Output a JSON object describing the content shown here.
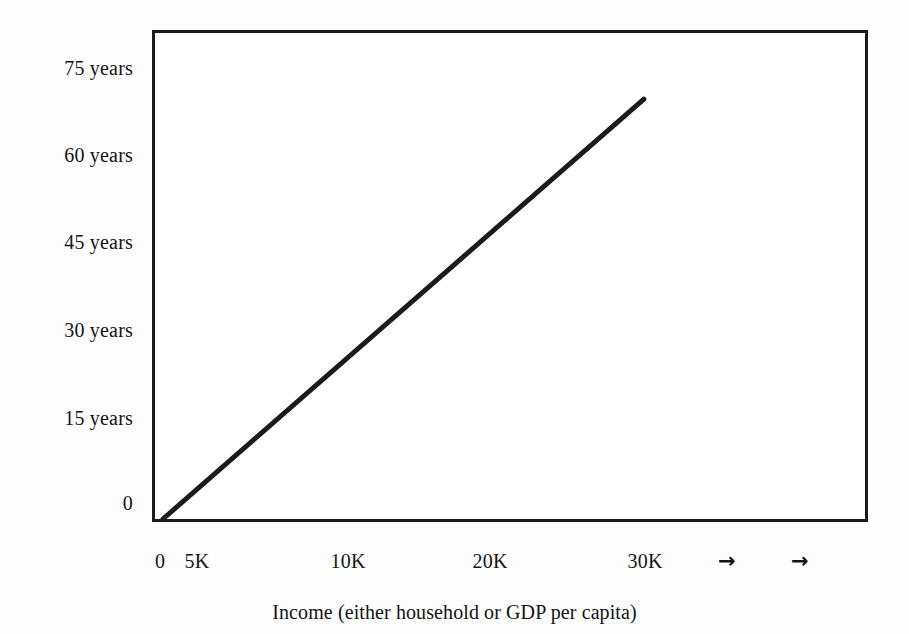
{
  "chart_data": {
    "type": "line",
    "title": "",
    "subtitle": "",
    "xlabel": "Income (either household or GDP per capita)",
    "ylabel": "",
    "grid": false,
    "legend": false,
    "legend_position": "none",
    "line_color": "#1b1b1b",
    "frame_color": "#1b1b1b",
    "background_color": "#ffffff",
    "x_ticks": [
      {
        "label": "0",
        "value": 0,
        "px": 160
      },
      {
        "label": "5K",
        "value": 5000,
        "px": 197
      },
      {
        "label": "10K",
        "value": 10000,
        "px": 348
      },
      {
        "label": "20K",
        "value": 20000,
        "px": 490
      },
      {
        "label": "30K",
        "value": 30000,
        "px": 645
      },
      {
        "label": "→",
        "value": null,
        "px": 727
      },
      {
        "label": "→",
        "value": null,
        "px": 800
      }
    ],
    "y_ticks": [
      {
        "label": "75 years",
        "value": 75,
        "px": 68
      },
      {
        "label": "60 years",
        "value": 60,
        "px": 155
      },
      {
        "label": "45 years",
        "value": 45,
        "px": 242
      },
      {
        "label": "30 years",
        "value": 30,
        "px": 330
      },
      {
        "label": "15 years",
        "value": 15,
        "px": 418
      },
      {
        "label": "0",
        "value": 0,
        "px": 503
      }
    ],
    "ylim": [
      0,
      85
    ],
    "series": [
      {
        "name": "life-expectancy",
        "points": [
          {
            "x": 0,
            "y": 0
          },
          {
            "x": 30000,
            "y": 70
          }
        ]
      }
    ]
  },
  "axis": {
    "x_title": "Income (either household or GDP per capita)"
  }
}
